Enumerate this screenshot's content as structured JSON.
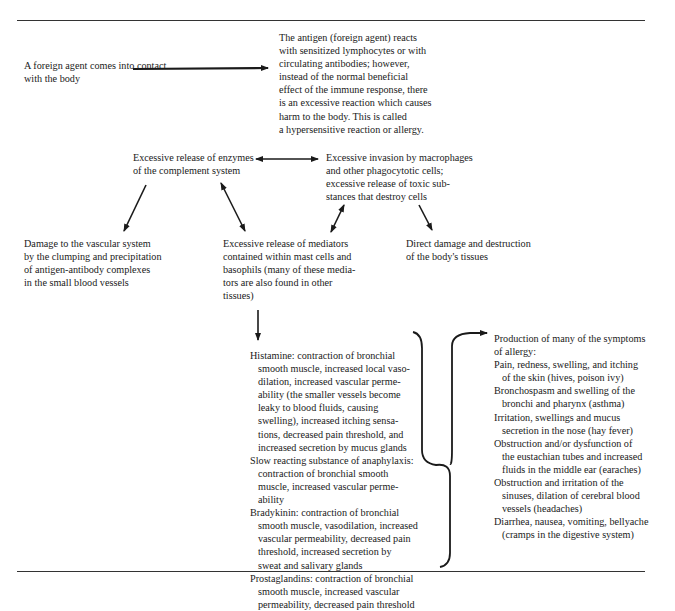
{
  "diagram": {
    "type": "flowchart",
    "topic": "Mechanism of allergic (hypersensitive) reaction",
    "nodes": {
      "foreign_agent": "A foreign agent comes into contact\nwith the body",
      "antigen_reaction": "The antigen (foreign agent) reacts\nwith sensitized lymphocytes or with\ncirculating antibodies; however,\ninstead of the normal beneficial\neffect of the immune response, there\nis an excessive reaction which causes\nharm to the body. This is called\na hypersensitive reaction or allergy.",
      "complement": "Excessive release of enzymes\nof the complement system",
      "macrophages": "Excessive invasion by macrophages\nand other phagocytotic cells;\nexcessive release of toxic sub-\nstances that destroy cells",
      "vascular_damage": "Damage to the vascular system\nby the clumping and precipitation\nof antigen-antibody complexes\nin the small blood vessels",
      "mediators": "Excessive release of mediators\ncontained within mast cells and\nbasophils (many of these media-\ntors are also found in other\ntissues)",
      "direct_damage": "Direct damage and destruction\nof the body's tissues"
    },
    "mediator_list": [
      {
        "lines": [
          "Histamine: contraction of bronchial",
          "smooth muscle, increased local vaso-",
          "dilation, increased vascular perme-",
          "ability (the smaller vessels become",
          "leaky to blood fluids, causing",
          "swelling), increased itching sensa-",
          "tions, decreased pain threshold, and",
          "increased secretion by mucus glands"
        ]
      },
      {
        "lines": [
          "Slow reacting substance of anaphylaxis:",
          "contraction of bronchial smooth",
          "muscle, increased vascular perme-",
          "ability"
        ]
      },
      {
        "lines": [
          "Bradykinin: contraction of bronchial",
          "smooth muscle, vasodilation, increased",
          "vascular permeability, decreased pain",
          "threshold, increased secretion by",
          "sweat and salivary glands"
        ]
      },
      {
        "lines": [
          "Prostaglandins: contraction of bronchial",
          "smooth muscle, increased vascular",
          "permeability, decreased pain threshold"
        ]
      }
    ],
    "symptoms_heading": [
      "Production of many of the symptoms",
      "of allergy:"
    ],
    "symptoms_list": [
      {
        "lines": [
          "Pain, redness, swelling, and itching",
          "of the skin (hives, poison ivy)"
        ]
      },
      {
        "lines": [
          "Bronchospasm and swelling of the",
          "bronchi and pharynx (asthma)"
        ]
      },
      {
        "lines": [
          "Irritation, swellings and mucus",
          "secretion in the nose (hay fever)"
        ]
      },
      {
        "lines": [
          "Obstruction and/or dysfunction of",
          "the eustachian tubes and increased",
          "fluids in the middle ear (earaches)"
        ]
      },
      {
        "lines": [
          "Obstruction and irritation of the",
          "sinuses, dilation of cerebral blood",
          "vessels (headaches)"
        ]
      },
      {
        "lines": [
          "Diarrhea, nausea, vomiting, bellyache",
          "(cramps in the digestive system)"
        ]
      }
    ],
    "edges": [
      {
        "from": "foreign_agent",
        "to": "antigen_reaction",
        "style": "arrow"
      },
      {
        "from": "complement",
        "to": "macrophages",
        "style": "double-arrow"
      },
      {
        "from": "complement",
        "to": "vascular_damage",
        "style": "arrow"
      },
      {
        "from": "complement",
        "to": "mediators",
        "style": "double-arrow"
      },
      {
        "from": "macrophages",
        "to": "mediators",
        "style": "double-arrow"
      },
      {
        "from": "macrophages",
        "to": "direct_damage",
        "style": "arrow"
      },
      {
        "from": "mediators",
        "to": "mediator_list",
        "style": "arrow"
      },
      {
        "from": "mediator_list",
        "to": "symptoms",
        "style": "brace-arrow"
      }
    ]
  }
}
